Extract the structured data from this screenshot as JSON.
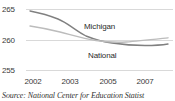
{
  "chart_data": {
    "type": "line",
    "title": "",
    "subtitle": "",
    "xlabel": "",
    "ylabel": "",
    "x": [
      2002,
      2003,
      2005,
      2007
    ],
    "xlim": [
      2001.6,
      2007.6
    ],
    "ylim": [
      253.5,
      266.5
    ],
    "yticks": [
      255,
      260,
      265
    ],
    "ytick_labels": [
      "255",
      "260",
      "265"
    ],
    "xtick_labels": [
      "2002",
      "2003",
      "2005",
      "2007"
    ],
    "grid": true,
    "grid_axis": "y",
    "legend": "inline-labels",
    "series": [
      {
        "name": "Michigan",
        "color": "#808080",
        "values": [
          264.5,
          263.6,
          260.6,
          259.5
        ]
      },
      {
        "name": "National",
        "color": "#b5b5b5",
        "values": [
          262.0,
          261.1,
          259.8,
          260.2
        ]
      }
    ],
    "annotations": [
      {
        "text": "Michigan",
        "x": 2004.1,
        "y": 261.8
      },
      {
        "text": "National",
        "x": 2004.3,
        "y": 257.6
      }
    ]
  },
  "axes": {
    "yticks": [
      {
        "label": "265",
        "top": 5
      },
      {
        "label": "260",
        "top": 36
      },
      {
        "label": "255",
        "top": 66
      }
    ],
    "gridlines": [
      {
        "value": "265",
        "top": 9
      },
      {
        "value": "260",
        "top": 40
      },
      {
        "value": "255",
        "top": 70
      }
    ],
    "xticks": [
      {
        "label": "2002",
        "left": 20
      },
      {
        "label": "2003",
        "left": 57
      },
      {
        "label": "2005",
        "left": 95
      },
      {
        "label": "2007",
        "left": 132
      }
    ]
  },
  "paths": {
    "michigan": "M30,11 C40,13 48,15 58,19 C68,23 76,31 86,36 C96,40 104,42 112,43 C122,44.5 134,45.5 145,45.5 C155,45.5 162,45 168,44",
    "national": "M30,26 C40,27.5 50,29.5 60,32 C72,35 84,38.5 96,40.5 C106,42 116,42.6 126,42 C138,41.2 150,39.8 168,37.8"
  },
  "source": {
    "text": "Source: National Center for Education Statist"
  },
  "series_labels": {
    "michigan": "Michigan",
    "national": "National"
  }
}
